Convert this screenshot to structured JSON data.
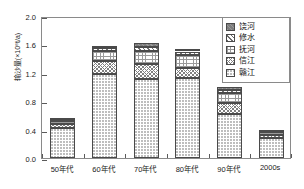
{
  "chart_data": {
    "type": "bar",
    "stacked": true,
    "title": "",
    "xlabel": "",
    "ylabel": "输沙量(×10⁸t/a)",
    "ylim": [
      0.0,
      2.0
    ],
    "yticks": [
      "0.0",
      "0.4",
      "0.8",
      "1.2",
      "1.6",
      "2.0"
    ],
    "ytick_values": [
      0.0,
      0.4,
      0.8,
      1.2,
      1.6,
      2.0
    ],
    "grid": false,
    "legend_position": "top-right",
    "categories": [
      "50年代",
      "60年代",
      "70年代",
      "80年代",
      "90年代",
      "2000s"
    ],
    "series": [
      {
        "name": "赣江",
        "pattern": "fine-dotted",
        "values": [
          0.42,
          1.19,
          1.11,
          1.13,
          0.62,
          0.28
        ]
      },
      {
        "name": "信江",
        "pattern": "cross-diagonal-mesh",
        "values": [
          0.06,
          0.17,
          0.21,
          0.14,
          0.15,
          0.05
        ]
      },
      {
        "name": "抚河",
        "pattern": "square-grid",
        "values": [
          0.04,
          0.15,
          0.19,
          0.18,
          0.14,
          0.04
        ]
      },
      {
        "name": "修水",
        "pattern": "diagonal-hatch",
        "values": [
          0.03,
          0.04,
          0.06,
          0.05,
          0.05,
          0.02
        ]
      },
      {
        "name": "饶河",
        "pattern": "solid-gray",
        "values": [
          0.02,
          0.03,
          0.05,
          0.03,
          0.04,
          0.01
        ]
      }
    ],
    "totals": [
      0.57,
      1.58,
      1.62,
      1.53,
      1.0,
      0.4
    ]
  },
  "legend": {
    "entries": [
      "饶河",
      "修水",
      "抚河",
      "信江",
      "赣江"
    ]
  },
  "colors": {
    "axis": "#8a8a8a",
    "text": "#1a1a1a",
    "bar_outline": "#4a4a4a",
    "raohe_fill": "#7d7d7d"
  }
}
